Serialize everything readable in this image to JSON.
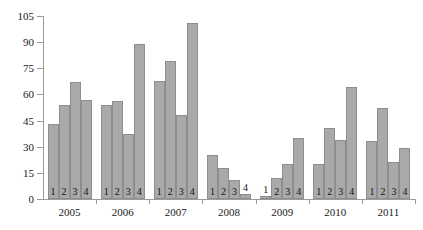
{
  "chart_data": {
    "type": "bar",
    "title": "",
    "subtitle": "",
    "xlabel": "",
    "ylabel": "",
    "ylim": [
      0,
      105
    ],
    "ytick_step": 15,
    "yticks": [
      0,
      15,
      30,
      45,
      60,
      75,
      90,
      105
    ],
    "ytick_labels": [
      "0",
      "15",
      "30",
      "45",
      "60",
      "75",
      "90",
      "105"
    ],
    "grid": false,
    "legend": "none",
    "bar_color": "#a9a9a9",
    "bar_border_color": "#8e8e8e",
    "axis_color": "#9a9a9a",
    "quarter_labels": [
      "1",
      "2",
      "3",
      "4"
    ],
    "categories": [
      "2005 1",
      "2005 2",
      "2005 3",
      "2005 4",
      "2006 1",
      "2006 2",
      "2006 3",
      "2006 4",
      "2007 1",
      "2007 2",
      "2007 3",
      "2007 4",
      "2008 1",
      "2008 2",
      "2008 3",
      "2008 4",
      "2009 1",
      "2009 2",
      "2009 3",
      "2009 4",
      "2010 1",
      "2010 2",
      "2010 3",
      "2010 4",
      "2011 1",
      "2011 2",
      "2011 3",
      "2011 4"
    ],
    "values": [
      43,
      54,
      67,
      57,
      54,
      56,
      37.5,
      89,
      68,
      79,
      48,
      101,
      25,
      18,
      11,
      3,
      1.5,
      12,
      20,
      35,
      20,
      41,
      34,
      64,
      33.5,
      52,
      21,
      29.5
    ],
    "groups": [
      {
        "year": "2005",
        "quarters": [
          "1",
          "2",
          "3",
          "4"
        ],
        "values": [
          43,
          54,
          67,
          57
        ]
      },
      {
        "year": "2006",
        "quarters": [
          "1",
          "2",
          "3",
          "4"
        ],
        "values": [
          54,
          56,
          37.5,
          89
        ]
      },
      {
        "year": "2007",
        "quarters": [
          "1",
          "2",
          "3",
          "4"
        ],
        "values": [
          68,
          79,
          48,
          101
        ]
      },
      {
        "year": "2008",
        "quarters": [
          "1",
          "2",
          "3",
          "4"
        ],
        "values": [
          25,
          18,
          11,
          3
        ]
      },
      {
        "year": "2009",
        "quarters": [
          "1",
          "2",
          "3",
          "4"
        ],
        "values": [
          1.5,
          12,
          20,
          35
        ]
      },
      {
        "year": "2010",
        "quarters": [
          "1",
          "2",
          "3",
          "4"
        ],
        "values": [
          20,
          41,
          34,
          64
        ]
      },
      {
        "year": "2011",
        "quarters": [
          "1",
          "2",
          "3",
          "4"
        ],
        "values": [
          33.5,
          52,
          21,
          29.5
        ]
      }
    ]
  }
}
